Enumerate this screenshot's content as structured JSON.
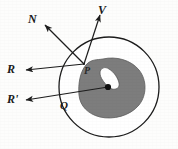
{
  "figure": {
    "caption": "",
    "background_color": "#fdfdfc",
    "outline_color": "#1d1d1d",
    "region_fill_color": "#7d7d7d",
    "region_stroke_color": "#5c5c5c",
    "point_color": "#111111",
    "labels": {
      "normal": "N",
      "velocity": "V",
      "reflection": "R",
      "reflection_prime": "R'",
      "point_p": "P",
      "region_q": "Q"
    },
    "geometry": {
      "circle": {
        "cx": 109,
        "cy": 87,
        "r": 50
      },
      "point_p": {
        "x": 84,
        "y": 64
      },
      "point_dot": {
        "x": 108,
        "y": 87
      },
      "vectors": [
        {
          "name": "N",
          "from_x": 84,
          "from_y": 64,
          "to_x": 43,
          "to_y": 23
        },
        {
          "name": "V",
          "from_x": 84,
          "from_y": 64,
          "to_x": 101,
          "to_y": 13
        },
        {
          "name": "R",
          "from_x": 84,
          "from_y": 64,
          "to_x": 24,
          "to_y": 70
        },
        {
          "name": "R'",
          "from_x": 108,
          "from_y": 87,
          "to_x": 24,
          "to_y": 100
        }
      ]
    }
  }
}
